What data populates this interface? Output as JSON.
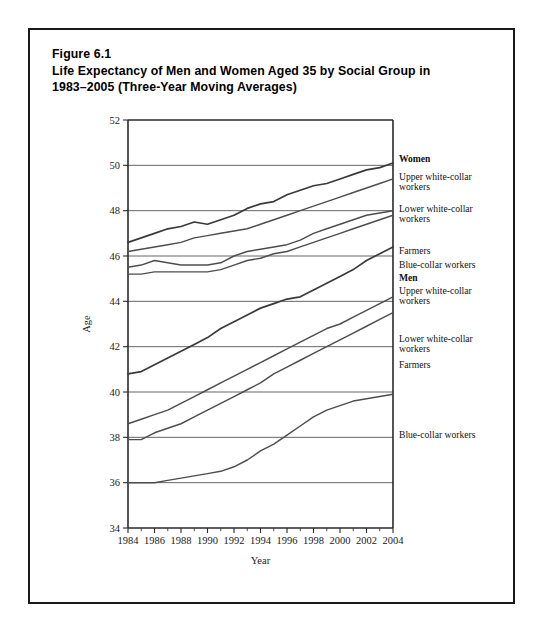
{
  "figure": {
    "number": "Figure 6.1",
    "title_line1": "Life Expectancy of Men and Women Aged 35 by Social Group in",
    "title_line2": "1983–2005 (Three-Year Moving Averages)"
  },
  "chart_data": {
    "type": "line",
    "title": "Life Expectancy of Men and Women Aged 35 by Social Group in 1983–2005 (Three-Year Moving Averages)",
    "xlabel": "Year",
    "ylabel": "Age",
    "xlim": [
      1984,
      2004
    ],
    "ylim": [
      34,
      52
    ],
    "xticks": [
      1984,
      1986,
      1988,
      1990,
      1992,
      1994,
      1996,
      1998,
      2000,
      2002,
      2004
    ],
    "xticks_minor_step": 1,
    "yticks": [
      34,
      36,
      38,
      40,
      42,
      44,
      46,
      48,
      50,
      52
    ],
    "grid": "horizontal",
    "legend_position": "right-inline",
    "line_color": "#4d4d4d",
    "x": [
      1984,
      1985,
      1986,
      1987,
      1988,
      1989,
      1990,
      1991,
      1992,
      1993,
      1994,
      1995,
      1996,
      1997,
      1998,
      1999,
      2000,
      2001,
      2002,
      2003,
      2004
    ],
    "series": [
      {
        "name": "Women, Upper white-collar workers",
        "group": "Women",
        "label": "Upper white-collar\nworkers",
        "values": [
          46.6,
          46.8,
          47.0,
          47.2,
          47.3,
          47.5,
          47.4,
          47.6,
          47.8,
          48.1,
          48.3,
          48.4,
          48.7,
          48.9,
          49.1,
          49.2,
          49.4,
          49.6,
          49.8,
          49.9,
          50.1
        ]
      },
      {
        "name": "Women, Lower white-collar workers",
        "group": "Women",
        "label": "Lower white-collar\nworkers",
        "values": [
          46.2,
          46.3,
          46.4,
          46.5,
          46.6,
          46.8,
          46.9,
          47.0,
          47.1,
          47.2,
          47.4,
          47.6,
          47.8,
          48.0,
          48.2,
          48.4,
          48.6,
          48.8,
          49.0,
          49.2,
          49.4
        ]
      },
      {
        "name": "Women, Farmers",
        "group": "Women",
        "label": "Farmers",
        "values": [
          45.5,
          45.6,
          45.8,
          45.7,
          45.6,
          45.6,
          45.6,
          45.7,
          46.0,
          46.2,
          46.3,
          46.4,
          46.5,
          46.7,
          47.0,
          47.2,
          47.4,
          47.6,
          47.8,
          47.9,
          48.0
        ]
      },
      {
        "name": "Women, Blue-collar workers",
        "group": "Women",
        "label": "Blue-collar workers",
        "values": [
          45.2,
          45.2,
          45.3,
          45.3,
          45.3,
          45.3,
          45.3,
          45.4,
          45.6,
          45.8,
          45.9,
          46.1,
          46.2,
          46.4,
          46.6,
          46.8,
          47.0,
          47.2,
          47.4,
          47.6,
          47.8
        ]
      },
      {
        "name": "Men, Upper white-collar workers",
        "group": "Men",
        "label": "Upper white-collar\nworkers",
        "values": [
          40.8,
          40.9,
          41.2,
          41.5,
          41.8,
          42.1,
          42.4,
          42.8,
          43.1,
          43.4,
          43.7,
          43.9,
          44.1,
          44.2,
          44.5,
          44.8,
          45.1,
          45.4,
          45.8,
          46.1,
          46.4
        ]
      },
      {
        "name": "Men, Lower white-collar workers",
        "group": "Men",
        "label": "Lower white-collar\nworkers",
        "values": [
          38.6,
          38.8,
          39.0,
          39.2,
          39.5,
          39.8,
          40.1,
          40.4,
          40.7,
          41.0,
          41.3,
          41.6,
          41.9,
          42.2,
          42.5,
          42.8,
          43.0,
          43.3,
          43.6,
          43.9,
          44.2
        ]
      },
      {
        "name": "Men, Farmers",
        "group": "Men",
        "label": "Farmers",
        "values": [
          37.9,
          37.9,
          38.2,
          38.4,
          38.6,
          38.9,
          39.2,
          39.5,
          39.8,
          40.1,
          40.4,
          40.8,
          41.1,
          41.4,
          41.7,
          42.0,
          42.3,
          42.6,
          42.9,
          43.2,
          43.5
        ]
      },
      {
        "name": "Men, Blue-collar workers",
        "group": "Men",
        "label": "Blue-collar workers",
        "values": [
          36.0,
          36.0,
          36.0,
          36.1,
          36.2,
          36.3,
          36.4,
          36.5,
          36.7,
          37.0,
          37.4,
          37.7,
          38.1,
          38.5,
          38.9,
          39.2,
          39.4,
          39.6,
          39.7,
          39.8,
          39.9
        ]
      }
    ],
    "group_headings": [
      "Women",
      "Men"
    ]
  },
  "side_labels": [
    {
      "key": "women-heading",
      "text": "Women",
      "bold": true,
      "top": 124
    },
    {
      "key": "women-upper-wc",
      "text": "Upper white-collar\nworkers",
      "bold": false,
      "top": 142
    },
    {
      "key": "women-lower-wc",
      "text": "Lower white-collar\nworkers",
      "bold": false,
      "top": 174
    },
    {
      "key": "women-farmers",
      "text": "Farmers",
      "bold": false,
      "top": 216
    },
    {
      "key": "women-blue-collar",
      "text": "Blue-collar workers",
      "bold": false,
      "top": 230
    },
    {
      "key": "men-heading",
      "text": "Men",
      "bold": true,
      "top": 243
    },
    {
      "key": "men-upper-wc",
      "text": "Upper white-collar\nworkers",
      "bold": false,
      "top": 256
    },
    {
      "key": "men-lower-wc",
      "text": "Lower white-collar\nworkers",
      "bold": false,
      "top": 304
    },
    {
      "key": "men-farmers",
      "text": "Farmers",
      "bold": false,
      "top": 330
    },
    {
      "key": "men-blue-collar",
      "text": "Blue-collar workers",
      "bold": false,
      "top": 400
    }
  ]
}
